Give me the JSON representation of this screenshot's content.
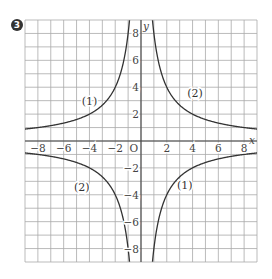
{
  "problem": {
    "number": "3"
  },
  "chart_data": {
    "type": "line",
    "title": "",
    "xlabel": "x",
    "ylabel": "y",
    "xlim": [
      -9,
      9
    ],
    "ylim": [
      -9,
      9
    ],
    "grid": true,
    "origin_label": "O",
    "x_ticks": [
      -8,
      -6,
      -4,
      -2,
      2,
      4,
      6,
      8
    ],
    "y_ticks": [
      -8,
      -6,
      -4,
      -2,
      2,
      4,
      6,
      8
    ],
    "note": "Curve formulas inferred from shape and approximate grid crossings (e.g. ~(4,2), ~(8,1)); not individually verified at tick precision.",
    "series": [
      {
        "name": "(1)",
        "formula_inferred": "y = -8/x",
        "label": "(1)",
        "label_positions": [
          {
            "x": -4,
            "y": 3
          },
          {
            "x": 4,
            "y": -3
          }
        ]
      },
      {
        "name": "(2)",
        "formula_inferred": "y = 8/x",
        "label": "(2)",
        "label_positions": [
          {
            "x": 4,
            "y": 3
          },
          {
            "x": -5,
            "y": -3
          }
        ]
      }
    ]
  },
  "labels": {
    "c1_q2": "(1)",
    "c2_q1": "(2)",
    "c2_q3": "(2)",
    "c1_q4": "(1)",
    "x_axis": "x",
    "y_axis": "y",
    "origin": "O"
  }
}
